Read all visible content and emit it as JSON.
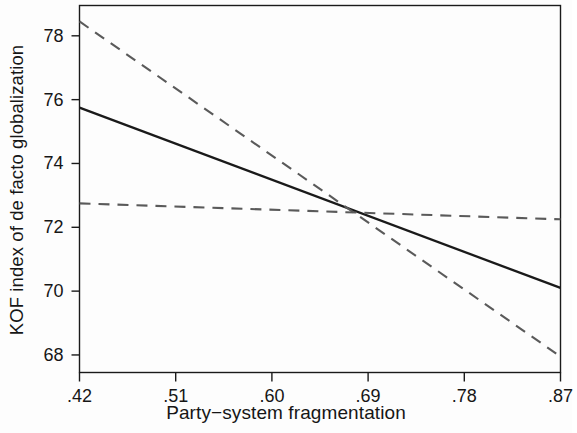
{
  "chart_data": {
    "type": "line",
    "title": "",
    "subtitle": "",
    "xlabel": "Party−system fragmentation",
    "ylabel": "KOF index of de facto globalization",
    "xlim": [
      0.42,
      0.87
    ],
    "ylim": [
      67.45,
      78.95
    ],
    "xticks": [
      0.42,
      0.51,
      0.6,
      0.69,
      0.78,
      0.87
    ],
    "xticklabels": [
      ".42",
      ".51",
      ".60",
      ".69",
      ".78",
      ".87"
    ],
    "yticks": [
      68,
      70,
      72,
      74,
      76,
      78
    ],
    "yticklabels": [
      "68",
      "70",
      "72",
      "74",
      "76",
      "78"
    ],
    "grid": false,
    "legend": null,
    "frame": "box",
    "series": [
      {
        "name": "fitted-line",
        "style": "solid",
        "color": "#1a1a1a",
        "x": [
          0.42,
          0.87
        ],
        "values": [
          75.75,
          70.1
        ]
      },
      {
        "name": "upper-confidence-bound",
        "style": "dashed",
        "color": "#5a5a5a",
        "x": [
          0.42,
          0.87
        ],
        "values": [
          78.45,
          67.95
        ]
      },
      {
        "name": "lower-confidence-bound",
        "style": "dashed",
        "color": "#5a5a5a",
        "x": [
          0.42,
          0.87
        ],
        "values": [
          72.75,
          72.25
        ]
      }
    ],
    "annotations": [
      {
        "name": "confidence-band-crossing",
        "x": 0.69,
        "y": 72.4,
        "text": ""
      }
    ]
  },
  "figure": {
    "background_color": "#fdfdfd",
    "axis_color": "#1a1a1a",
    "text_color": "#161616"
  }
}
